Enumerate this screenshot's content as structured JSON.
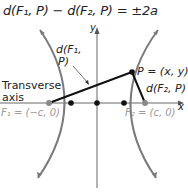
{
  "diagram": {
    "equation": "d(F₁, P) − d(F₂, P) = ±2a",
    "labels": {
      "d1": "d(F₁, P)",
      "d1_line1": "d(F₁,",
      "d1_line2": "P)",
      "transverse_line1": "Transverse",
      "transverse_line2": "axis",
      "point_p": "P = (x, y)",
      "d2": "d(F₂, P)",
      "focus1": "F₁ = (−c, 0)",
      "focus2": "F₂ = (c, 0)",
      "x_axis": "x",
      "y_axis": "y"
    },
    "colors": {
      "curve": "#7a7a7a",
      "axis": "#555555",
      "segment": "#111111",
      "focus_dot": "#8a8a8a",
      "vertex_dot": "#111111"
    }
  }
}
